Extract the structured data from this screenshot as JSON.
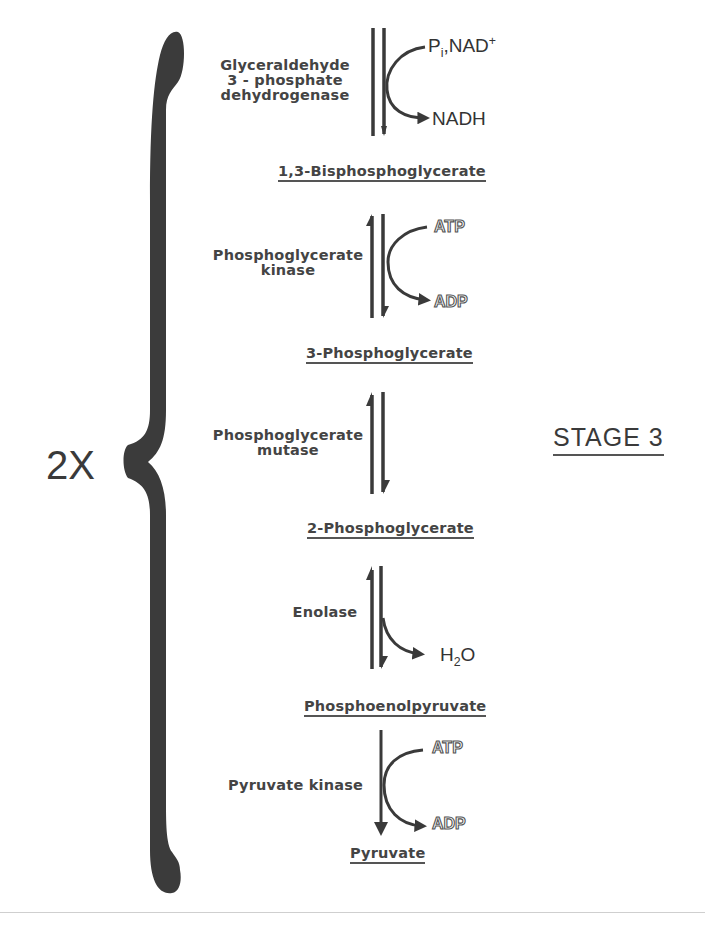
{
  "diagram": {
    "multiplier": "2X",
    "stage_label": "STAGE 3",
    "steps": [
      {
        "enzyme_lines": [
          "Glyceraldehyde",
          "3 - phosphate",
          "dehydrogenase"
        ],
        "direction": "reversible",
        "cofactor_in": {
          "base": "P",
          "sub": "i",
          "rest": ",NAD",
          "sup": "+"
        },
        "cofactor_out": "NADH",
        "product": "1,3-Bisphosphoglycerate"
      },
      {
        "enzyme_lines": [
          "Phosphoglycerate",
          "kinase"
        ],
        "direction": "reversible",
        "cofactor_in": "ADP",
        "cofactor_out": "ATP",
        "cofactor_top": "ATP",
        "cofactor_bottom": "ADP",
        "product": "3-Phosphoglycerate"
      },
      {
        "enzyme_lines": [
          "Phosphoglycerate",
          "mutase"
        ],
        "direction": "reversible",
        "product": "2-Phosphoglycerate"
      },
      {
        "enzyme_lines": [
          "Enolase"
        ],
        "direction": "reversible",
        "cofactor_out": {
          "base": "H",
          "sub": "2",
          "rest": "O"
        },
        "product": "Phosphoenolpyruvate"
      },
      {
        "enzyme_lines": [
          "Pyruvate kinase"
        ],
        "direction": "irreversible",
        "cofactor_top": "ATP",
        "cofactor_bottom": "ADP",
        "product": "Pyruvate"
      }
    ],
    "colors": {
      "ink": "#3a3a3a",
      "brace": "#3b3b3b",
      "rule": "#cfcfcf",
      "background": "#ffffff"
    }
  }
}
